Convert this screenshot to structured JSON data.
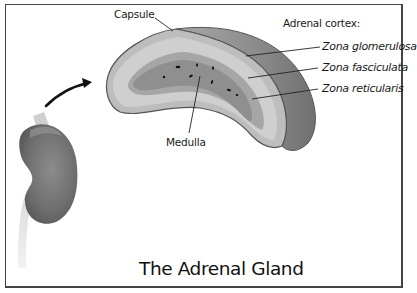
{
  "diagram": {
    "title": "The Adrenal Gland",
    "labels": {
      "capsule": "Capsule",
      "medulla": "Medulla",
      "cortex_heading": "Adrenal cortex:",
      "zones": [
        "Zona glomerulosa",
        "Zona fasciculata",
        "Zona reticularis"
      ]
    },
    "colors": {
      "border": "#444444",
      "capsule_outline": "#555555",
      "cortex_outer": "#bdbdbd",
      "cortex_zone": "#cfcfcf",
      "medulla": "#8f8f8f",
      "gland_side": "#8a8a8a",
      "kidney": "#7a7a7a",
      "arrow": "#111111",
      "text": "#1a1a1a"
    },
    "elements": [
      "kidney-illustration",
      "arrow",
      "adrenal-gland-cross-section"
    ]
  }
}
